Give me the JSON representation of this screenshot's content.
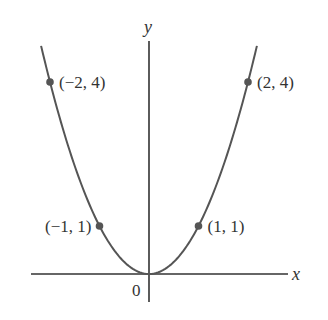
{
  "chart_data": {
    "type": "line",
    "title": "",
    "function": "y = x^2",
    "xlabel": "x",
    "ylabel": "y",
    "origin_label": "0",
    "xlim": [
      -2.4,
      2.8
    ],
    "ylim": [
      -0.6,
      4.8
    ],
    "grid": false,
    "legend": null,
    "curve": {
      "x_range": [
        -2.18,
        2.18
      ],
      "color": "#555555"
    },
    "points": [
      {
        "x": -2,
        "y": 4,
        "label": "(−2, 4)",
        "label_side": "right"
      },
      {
        "x": -1,
        "y": 1,
        "label": "(−1, 1)",
        "label_side": "left"
      },
      {
        "x": 1,
        "y": 1,
        "label": "(1, 1)",
        "label_side": "right"
      },
      {
        "x": 2,
        "y": 4,
        "label": "(2, 4)",
        "label_side": "right"
      }
    ],
    "colors": {
      "axis": "#333333",
      "curve": "#555555",
      "point": "#555555",
      "text": "#333333"
    }
  }
}
